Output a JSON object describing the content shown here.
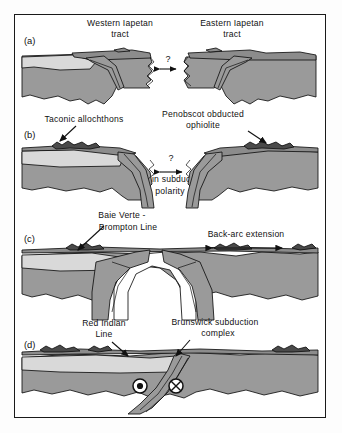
{
  "figure": {
    "kind": "geological-cross-section-sequence",
    "frame_border_color": "#1a1a1a",
    "background_color": "#ffffff",
    "palette": {
      "crust_light": "#d9d9d9",
      "crust_mid": "#9a9a9a",
      "crust_dark": "#8c8c8c",
      "mantle_white": "#ffffff",
      "outline": "#111111"
    }
  },
  "panels": [
    {
      "tag": "(a)",
      "labels": [
        {
          "name": "western-iapetan-tract",
          "line1": "Western  Iapetan",
          "line2": "tract"
        },
        {
          "name": "eastern-iapetan-tract",
          "line1": "Eastern  Iapetan",
          "line2": "tract"
        }
      ],
      "annotations": [
        {
          "name": "question-mark",
          "text": "?"
        }
      ]
    },
    {
      "tag": "(b)",
      "labels": [
        {
          "name": "taconic-allochthons",
          "line1": "Taconic  allochthons",
          "line2": ""
        },
        {
          "name": "penobscot-obducted-ophiolite",
          "line1": "Penobscot  obducted",
          "line2": "ophiolite"
        },
        {
          "name": "flip-in-subduction-polarity",
          "line1": "Flip in subduction",
          "line2": "polarity"
        }
      ],
      "annotations": [
        {
          "name": "question-mark",
          "text": "?"
        }
      ]
    },
    {
      "tag": "(c)",
      "labels": [
        {
          "name": "baie-verte-brompton-line",
          "line1": "Baie Verte  -",
          "line2": "Brompton  Line"
        },
        {
          "name": "back-arc-extension",
          "line1": "Back-arc extension",
          "line2": ""
        }
      ],
      "annotations": []
    },
    {
      "tag": "(d)",
      "labels": [
        {
          "name": "red-indian-line",
          "line1": "Red Indian",
          "line2": "Line"
        },
        {
          "name": "brunswick-subduction-complex",
          "line1": "Brunswick subduction",
          "line2": "complex"
        }
      ],
      "annotations": [
        {
          "name": "motion-toward-viewer",
          "text": "⊙"
        },
        {
          "name": "motion-away-from-viewer",
          "text": "⊗"
        }
      ]
    }
  ]
}
